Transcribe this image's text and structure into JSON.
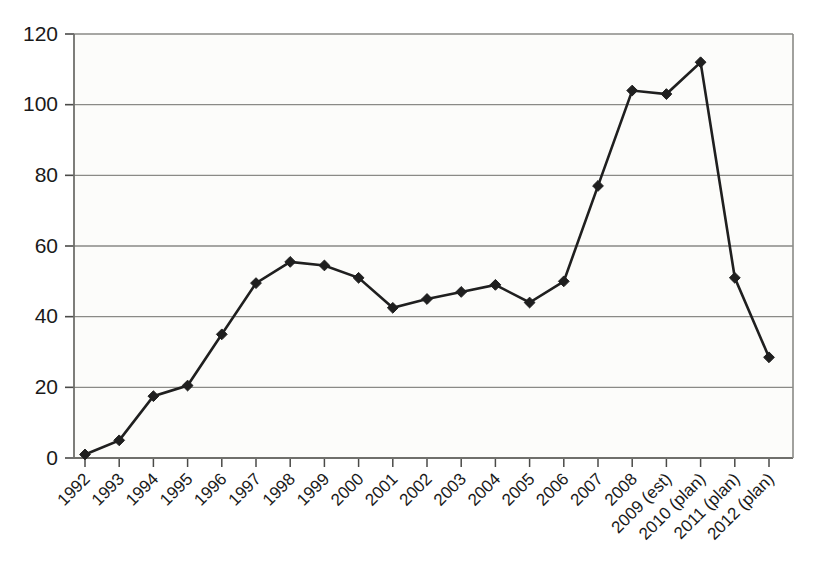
{
  "chart_data": {
    "type": "line",
    "title": "",
    "subtitle": "",
    "xlabel": "",
    "ylabel": "",
    "ylim": [
      0,
      120
    ],
    "ytick_values": [
      0,
      20,
      40,
      60,
      80,
      100,
      120
    ],
    "ytick_labels": [
      "0",
      "20",
      "40",
      "60",
      "80",
      "100",
      "120"
    ],
    "grid": true,
    "legend": false,
    "legend_position": "none",
    "categories": [
      "1992",
      "1993",
      "1994",
      "1995",
      "1996",
      "1997",
      "1998",
      "1999",
      "2000",
      "2001",
      "2002",
      "2003",
      "2004",
      "2005",
      "2006",
      "2007",
      "2008",
      "2009 (est)",
      "2010 (plan)",
      "2011 (plan)",
      "2012 (plan)"
    ],
    "values": [
      1,
      5,
      17.5,
      20.5,
      35,
      49.5,
      55.5,
      54.5,
      51,
      42.5,
      45,
      47,
      49,
      44,
      50,
      77,
      104,
      103,
      112,
      51,
      28.5
    ],
    "series": [
      {
        "name": "series-1",
        "color": "#1f1f1f",
        "marker": "diamond",
        "values": [
          1,
          5,
          17.5,
          20.5,
          35,
          49.5,
          55.5,
          54.5,
          51,
          42.5,
          45,
          47,
          49,
          44,
          50,
          77,
          104,
          103,
          112,
          51,
          28.5
        ]
      }
    ]
  },
  "style": {
    "line_color": "#1f1f1f",
    "marker_color": "#1f1f1f",
    "grid_color": "#8a8a86",
    "axis_color": "#6f6f6b",
    "text_color": "#1a1a1a",
    "plot_background": "#fcfcfa",
    "page_background": "#ffffff"
  },
  "geometry": {
    "plot_left": 74,
    "plot_right": 793,
    "plot_top": 34,
    "plot_bottom": 458,
    "x_step": 34.2,
    "x_first": 85,
    "xtick_label_rotation": -45
  }
}
